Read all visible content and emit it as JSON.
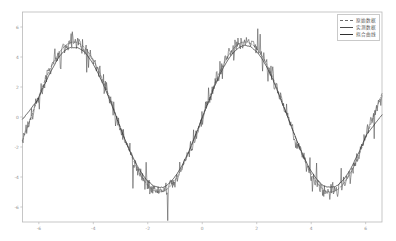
{
  "chart_data": {
    "type": "line",
    "title": "",
    "xlabel": "",
    "ylabel": "",
    "xlim": [
      -6.6,
      6.6
    ],
    "ylim": [
      -7.0,
      7.0
    ],
    "grid": false,
    "legend_position": "upper-right",
    "xticks": [
      -6,
      -4,
      -2,
      0,
      2,
      4,
      6
    ],
    "xtick_labels": [
      "-6",
      "-4",
      "-2",
      "0",
      "2",
      "4",
      "6"
    ],
    "yticks": [
      -6,
      -4,
      -2,
      0,
      2,
      4,
      6
    ],
    "ytick_labels": [
      "-6",
      "-4",
      "-2",
      "0",
      "2",
      "4",
      "6"
    ],
    "series": [
      {
        "name": "原始数据",
        "style": "dashed",
        "color": "#6b6b6b",
        "description": "underlying clean sine, amplitude 5, period 2pi"
      },
      {
        "name": "实测数据",
        "style": "solid",
        "color": "#4a4a4a",
        "description": "noisy measured samples with high-frequency spikes"
      },
      {
        "name": "拟合曲线",
        "style": "solid",
        "color": "#2f2f2f",
        "description": "smooth fitted curve through the noisy data"
      }
    ],
    "function": "y = 5 * sin(x)",
    "amplitude": 5,
    "period": 6.283,
    "noise_amplitude": 0.45,
    "n_points": 600
  },
  "axes": {
    "frame_color": "#b9b9b9",
    "background": "#ffffff"
  }
}
